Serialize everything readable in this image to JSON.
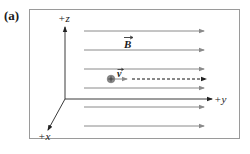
{
  "panel": {
    "label": "(a)"
  },
  "axes": {
    "z_label": "+z",
    "y_label": "+y",
    "x_label": "+x"
  },
  "field": {
    "label": "B",
    "label_has_vector_arrow": true,
    "direction": "+y",
    "line_count": 6,
    "line_y_positions": [
      31,
      50,
      69,
      88,
      107,
      126
    ],
    "line_x_start": 84,
    "line_x_end": 205
  },
  "particle": {
    "symbol": "positive-charge",
    "velocity_label": "v",
    "velocity_label_has_vector_arrow": true,
    "trajectory": "dashed line along +y"
  },
  "colors": {
    "frame": "#9a9a9a",
    "field_lines": "#8a8a8a",
    "axes": "#3a3a3a",
    "text": "#1a1a1a",
    "particle": "#888888"
  }
}
